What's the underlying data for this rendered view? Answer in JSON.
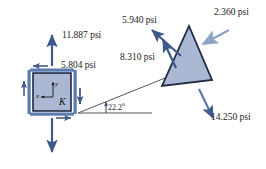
{
  "figure": {
    "type": "engineering-stress-diagram",
    "title": "",
    "background_color": "#ffffff",
    "shape_fill_color": "#aab8d4",
    "shape_stroke_color": "#1f2a44",
    "arrow_color": "#3d5a8a",
    "arrow_color_light": "#8da4c8",
    "line_color": "#4a4a4a",
    "text_color": "#1a1a1a"
  },
  "element_k": {
    "label": "K",
    "axis_y_label": "y",
    "axis_x_label": "x",
    "stress_normal_vertical": "11.887 psi",
    "stress_shear": "5.804 psi"
  },
  "inclined_plane": {
    "angle_label": "22.2",
    "angle_degree_symbol": "o"
  },
  "wedge": {
    "stress_upper_left": "5.940 psi",
    "stress_lower_left": "8.310 psi",
    "stress_upper_right": "2.360 psi",
    "stress_lower_right": "14.250 psi"
  }
}
